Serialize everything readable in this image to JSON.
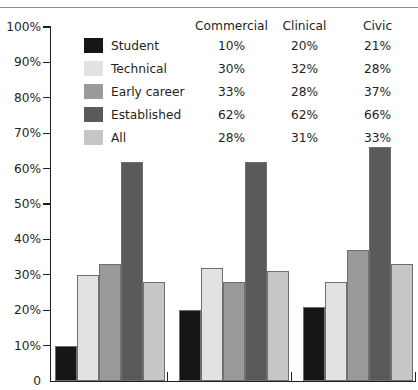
{
  "figure": {
    "has_top_rule": true,
    "background": "#ffffff"
  },
  "legend": {
    "column_headers": [
      "Commercial",
      "Clinical",
      "Civic"
    ],
    "entries": [
      {
        "label": "Student",
        "color": "#161616",
        "values": [
          "10%",
          "20%",
          "21%"
        ]
      },
      {
        "label": "Technical",
        "color": "#e2e2e2",
        "values": [
          "30%",
          "32%",
          "28%"
        ]
      },
      {
        "label": "Early career",
        "color": "#9a9a9a",
        "values": [
          "33%",
          "28%",
          "37%"
        ]
      },
      {
        "label": "Established",
        "color": "#5a5a5a",
        "values": [
          "62%",
          "62%",
          "66%"
        ]
      },
      {
        "label": "All",
        "color": "#c6c6c6",
        "values": [
          "28%",
          "31%",
          "33%"
        ]
      }
    ]
  },
  "axis": {
    "y_ticks": [
      "100%",
      "90%",
      "80%",
      "70%",
      "60%",
      "50%",
      "40%",
      "30%",
      "20%",
      "10%",
      "0"
    ]
  },
  "chart_data": {
    "type": "bar",
    "title": "",
    "xlabel": "",
    "ylabel": "",
    "ylim": [
      0,
      100
    ],
    "ytick_values": [
      0,
      10,
      20,
      30,
      40,
      50,
      60,
      70,
      80,
      90,
      100
    ],
    "ytick_labels": [
      "0",
      "10%",
      "20%",
      "30%",
      "40%",
      "50%",
      "60%",
      "70%",
      "80%",
      "90%",
      "100%"
    ],
    "grid": false,
    "legend_position": "top-inside",
    "categories": [
      "Commercial",
      "Clinical",
      "Civic"
    ],
    "series": [
      {
        "name": "Student",
        "color": "#161616",
        "values": [
          10,
          20,
          21
        ]
      },
      {
        "name": "Technical",
        "color": "#e2e2e2",
        "values": [
          30,
          32,
          28
        ]
      },
      {
        "name": "Early career",
        "color": "#9a9a9a",
        "values": [
          33,
          28,
          37
        ]
      },
      {
        "name": "Established",
        "color": "#5a5a5a",
        "values": [
          62,
          62,
          66
        ]
      },
      {
        "name": "All",
        "color": "#c6c6c6",
        "values": [
          28,
          31,
          33
        ]
      }
    ],
    "data_labels": [
      [
        "10%",
        "20%",
        "21%"
      ],
      [
        "30%",
        "32%",
        "28%"
      ],
      [
        "33%",
        "28%",
        "37%"
      ],
      [
        "62%",
        "62%",
        "66%"
      ],
      [
        "28%",
        "31%",
        "33%"
      ]
    ]
  },
  "plot_geometry": {
    "x0": 50,
    "x1": 416,
    "y_zero": 381,
    "y_top": 27,
    "bar_width": 22,
    "group_starts": [
      55,
      179,
      303
    ],
    "group_separators": [
      166.5,
      290.5
    ]
  }
}
